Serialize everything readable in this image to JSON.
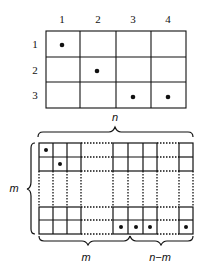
{
  "top_matrix": {
    "column_labels": [
      "1",
      "2",
      "3",
      "4"
    ],
    "row_labels": [
      "1",
      "2",
      "3"
    ],
    "dots": [
      [
        1,
        1
      ],
      [
        2,
        2
      ],
      [
        3,
        3
      ],
      [
        3,
        4
      ]
    ]
  },
  "bottom_matrix": {
    "top_brace_label": "n",
    "left_brace_label": "m",
    "bottom_left_brace_label": "m",
    "bottom_right_brace_label": "n−m"
  }
}
